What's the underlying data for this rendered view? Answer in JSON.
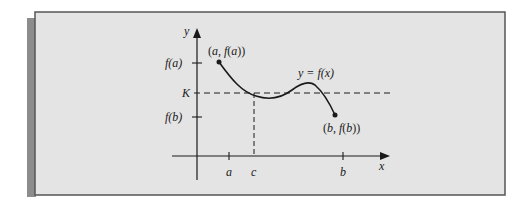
{
  "figure": {
    "colors": {
      "panel_fill": "#e4e4e4",
      "panel_border": "#555555",
      "shadow_band": "#8c8c8c",
      "ink": "#1a1a1a"
    },
    "axes": {
      "x_label": "x",
      "y_label": "y"
    },
    "x_ticks": [
      {
        "id": "a",
        "label": "a"
      },
      {
        "id": "c",
        "label": "c"
      },
      {
        "id": "b",
        "label": "b"
      }
    ],
    "y_ticks": [
      {
        "id": "fa",
        "label": "f(a)"
      },
      {
        "id": "K",
        "label": "K"
      },
      {
        "id": "fb",
        "label": "f(b)"
      }
    ],
    "point_labels": {
      "start": "(a, f(a))",
      "end": "(b, f(b))"
    },
    "curve_label": "y = f(x)"
  }
}
